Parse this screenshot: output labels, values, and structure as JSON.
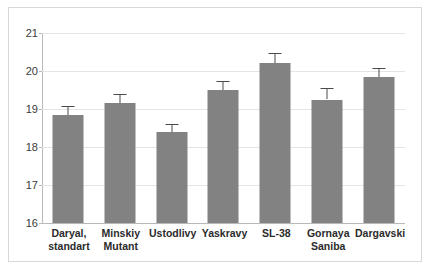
{
  "chart_data": {
    "type": "bar",
    "title": "",
    "xlabel": "",
    "ylabel": "",
    "categories": [
      "Daryal, standart",
      "Minskiy Mutant",
      "Ustodlivy",
      "Yaskravy",
      "SL-38",
      "Gornaya Saniba",
      "Dargavski"
    ],
    "category_lines": [
      [
        "Daryal,",
        "standart"
      ],
      [
        "Minskiy",
        "Mutant"
      ],
      [
        "Ustodlivy",
        ""
      ],
      [
        "Yaskravy",
        ""
      ],
      [
        "SL-38",
        ""
      ],
      [
        "Gornaya",
        "Saniba"
      ],
      [
        "Dargavski",
        ""
      ]
    ],
    "values": [
      18.85,
      19.15,
      18.4,
      19.5,
      20.2,
      19.25,
      19.85
    ],
    "errors": [
      0.22,
      0.25,
      0.2,
      0.25,
      0.27,
      0.3,
      0.22
    ],
    "error_upper": [
      19.07,
      19.4,
      18.6,
      19.75,
      20.47,
      19.55,
      20.07
    ],
    "error_lower": [
      18.63,
      18.9,
      18.2,
      19.25,
      19.93,
      18.95,
      19.63
    ],
    "ylim": [
      16,
      21
    ],
    "yticks": [
      16,
      17,
      18,
      19,
      20,
      21
    ],
    "ytick_labels": [
      "16",
      "17",
      "18",
      "19",
      "20",
      "21"
    ],
    "grid": true,
    "legend": false,
    "bar_color": "#828282",
    "error_color": "#4a4a4a",
    "gridline_color": "#e4e4e4",
    "axis_color": "#b9b9b9",
    "frame_color": "#d8d8d8"
  }
}
